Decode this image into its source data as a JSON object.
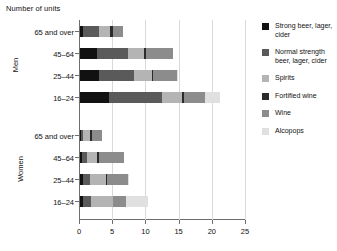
{
  "chart_data": {
    "type": "bar",
    "orientation": "horizontal",
    "stacked": true,
    "title": "",
    "xlabel": "Number of units",
    "ylabel": "",
    "xlim": [
      0,
      25
    ],
    "xticks": [
      0,
      5,
      10,
      15,
      20,
      25
    ],
    "grid": true,
    "legend_position": "right",
    "groups": [
      {
        "name": "Men",
        "categories": [
          "65 and over",
          "45–64",
          "25–44",
          "16–24"
        ]
      },
      {
        "name": "Women",
        "categories": [
          "65 and over",
          "45–64",
          "25–44",
          "16–24"
        ]
      }
    ],
    "series": [
      {
        "name": "Strong beer, lager, cider",
        "color": "#111111",
        "values_men": [
          0.5,
          2.6,
          2.8,
          4.4
        ],
        "values_women": [
          0.1,
          0.3,
          0.4,
          0.5
        ]
      },
      {
        "name": "Normal strength beer, lager, cider",
        "color": "#5a5a5a",
        "values_men": [
          2.3,
          4.6,
          5.4,
          8.0
        ],
        "values_women": [
          0.4,
          0.7,
          1.1,
          1.2
        ]
      },
      {
        "name": "Spirits",
        "color": "#b4b4b4",
        "values_men": [
          1.7,
          2.4,
          2.6,
          3.0
        ],
        "values_women": [
          1.0,
          1.6,
          2.4,
          3.2
        ]
      },
      {
        "name": "Fortified wine",
        "color": "#2b2b2b",
        "values_men": [
          0.4,
          0.4,
          0.2,
          0.2
        ],
        "values_women": [
          0.3,
          0.3,
          0.2,
          0.1
        ]
      },
      {
        "name": "Wine",
        "color": "#8c8c8c",
        "values_men": [
          1.6,
          4.0,
          3.6,
          3.2
        ],
        "values_women": [
          1.5,
          3.7,
          3.1,
          2.0
        ]
      },
      {
        "name": "Alcopops",
        "color": "#e0e0e0",
        "values_men": [
          0.0,
          0.0,
          0.1,
          2.3
        ],
        "values_women": [
          0.0,
          0.0,
          0.2,
          3.3
        ]
      }
    ],
    "bar_totals": {
      "men": [
        6.5,
        14.0,
        14.7,
        21.1
      ],
      "women": [
        3.3,
        6.6,
        7.4,
        10.3
      ]
    }
  },
  "legend": {
    "items": [
      {
        "label": "Strong beer, lager, cider",
        "color": "#111111"
      },
      {
        "label": "Normal strength beer, lager, cider",
        "color": "#5a5a5a"
      },
      {
        "label": "Spirits",
        "color": "#b4b4b4"
      },
      {
        "label": "Fortified wine",
        "color": "#2b2b2b"
      },
      {
        "label": "Wine",
        "color": "#8c8c8c"
      },
      {
        "label": "Alcopops",
        "color": "#e0e0e0"
      }
    ]
  }
}
